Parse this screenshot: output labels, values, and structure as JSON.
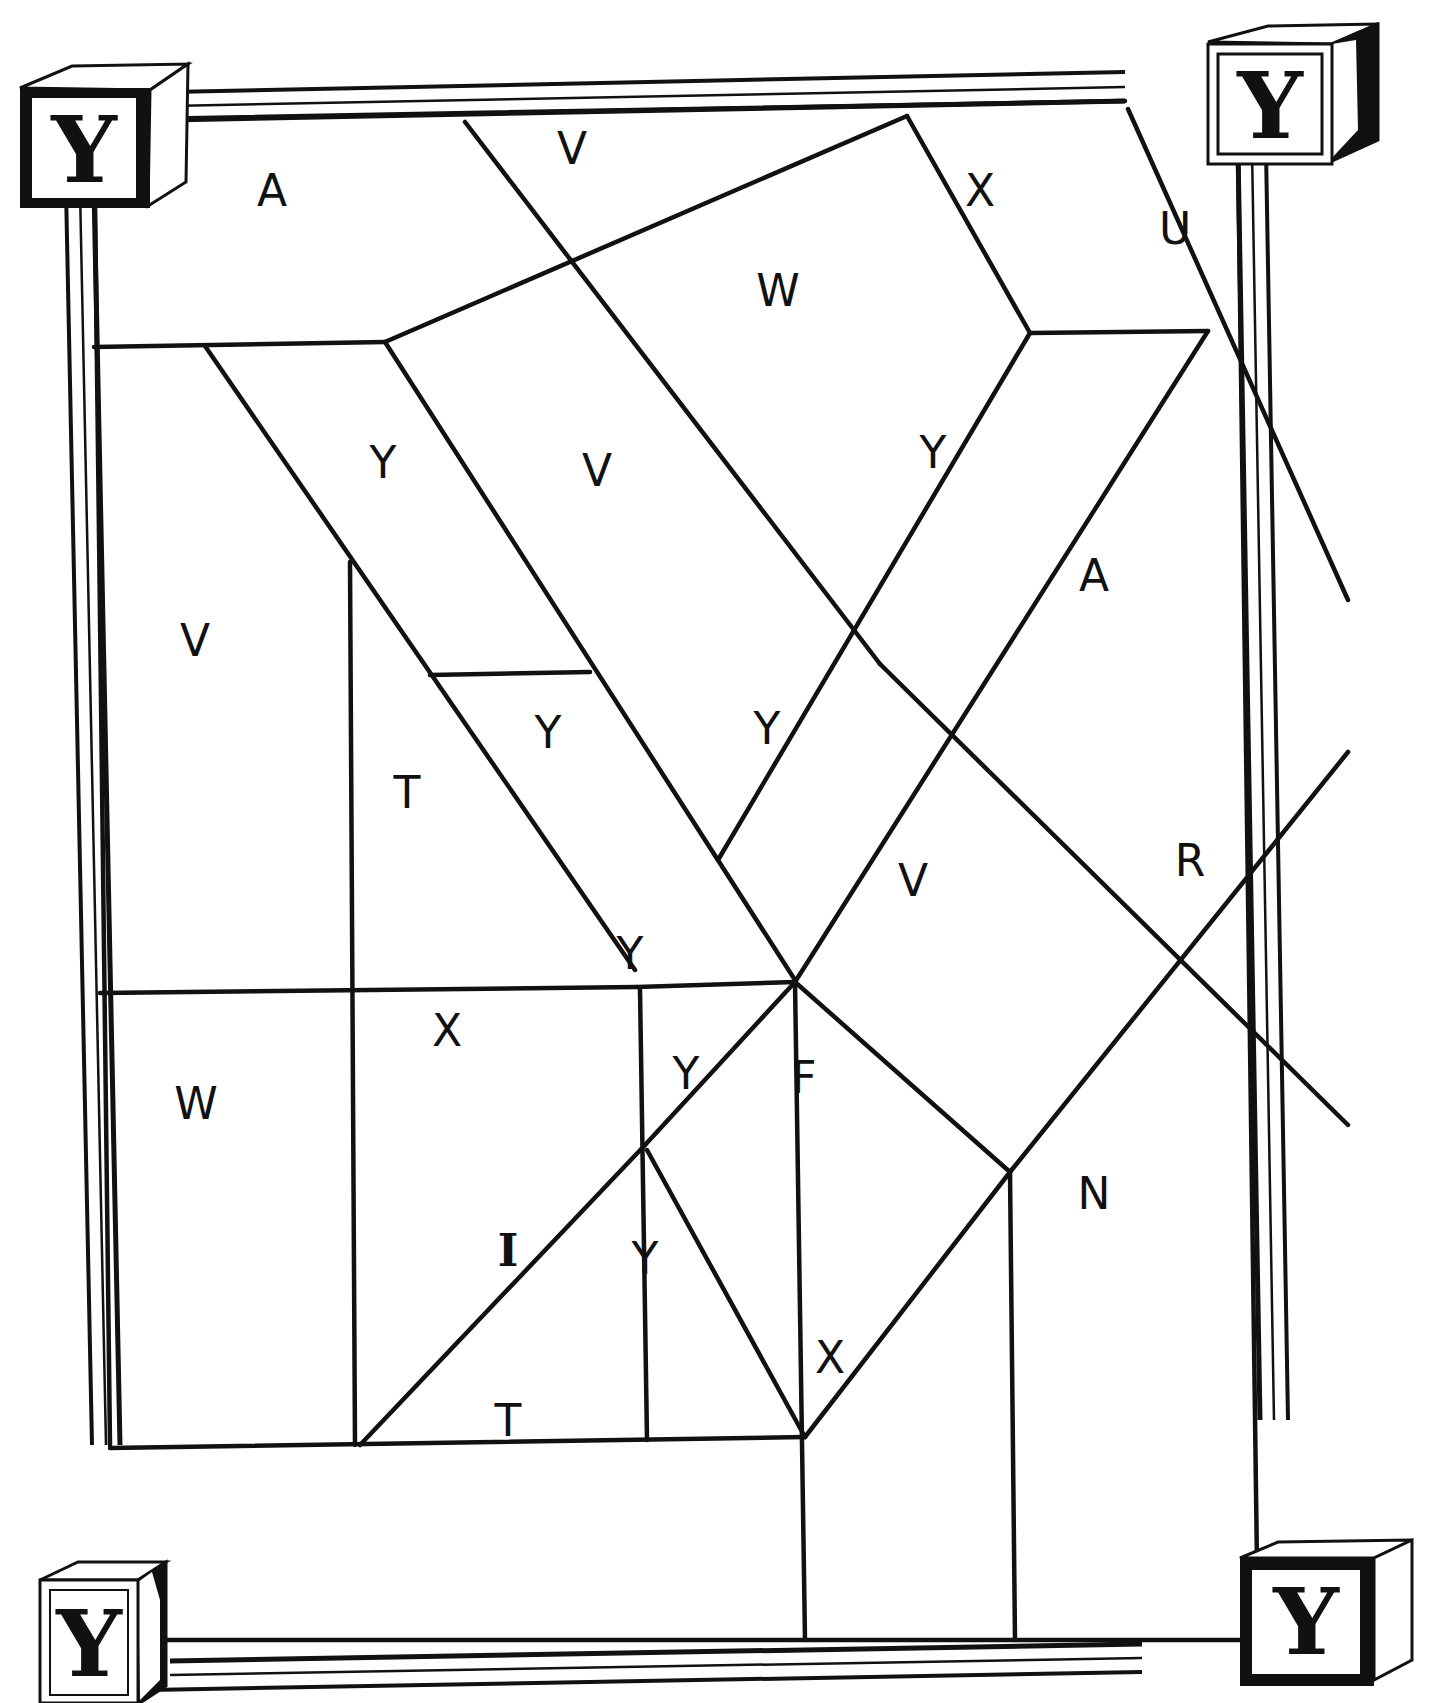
{
  "puzzle": {
    "type": "color-by-letter mosaic",
    "hidden_letter": "Y",
    "colors": {
      "line": "#111111",
      "background": "#ffffff"
    }
  },
  "corner_blocks": [
    {
      "position": "top-left",
      "letter": "Y"
    },
    {
      "position": "top-right",
      "letter": "Y"
    },
    {
      "position": "bottom-left",
      "letter": "Y"
    },
    {
      "position": "bottom-right",
      "letter": "Y"
    }
  ],
  "regions": [
    {
      "letter": "A",
      "x": 272,
      "y": 190
    },
    {
      "letter": "V",
      "x": 572,
      "y": 148
    },
    {
      "letter": "X",
      "x": 980,
      "y": 190
    },
    {
      "letter": "U",
      "x": 1175,
      "y": 228
    },
    {
      "letter": "W",
      "x": 778,
      "y": 290
    },
    {
      "letter": "Y",
      "x": 383,
      "y": 462
    },
    {
      "letter": "V",
      "x": 597,
      "y": 470
    },
    {
      "letter": "Y",
      "x": 933,
      "y": 452
    },
    {
      "letter": "A",
      "x": 1094,
      "y": 575
    },
    {
      "letter": "V",
      "x": 195,
      "y": 640
    },
    {
      "letter": "Y",
      "x": 548,
      "y": 732
    },
    {
      "letter": "Y",
      "x": 767,
      "y": 728
    },
    {
      "letter": "T",
      "x": 407,
      "y": 792
    },
    {
      "letter": "V",
      "x": 913,
      "y": 880
    },
    {
      "letter": "R",
      "x": 1190,
      "y": 860
    },
    {
      "letter": "Y",
      "x": 630,
      "y": 953
    },
    {
      "letter": "X",
      "x": 447,
      "y": 1030
    },
    {
      "letter": "Y",
      "x": 686,
      "y": 1073
    },
    {
      "letter": "F",
      "x": 804,
      "y": 1077
    },
    {
      "letter": "W",
      "x": 196,
      "y": 1103
    },
    {
      "letter": "N",
      "x": 1094,
      "y": 1193
    },
    {
      "letter": "I",
      "x": 508,
      "y": 1250
    },
    {
      "letter": "Y",
      "x": 645,
      "y": 1258
    },
    {
      "letter": "X",
      "x": 830,
      "y": 1357
    },
    {
      "letter": "T",
      "x": 508,
      "y": 1420
    }
  ]
}
